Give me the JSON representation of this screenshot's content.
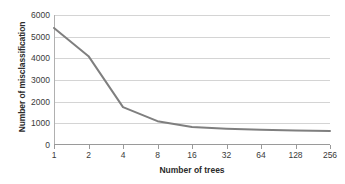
{
  "chart_data": {
    "type": "line",
    "title": "",
    "subtitle": "",
    "xlabel": "Number of trees",
    "ylabel": "Number of misclassification",
    "x_scale": "log2-categorical",
    "categories": [
      "1",
      "2",
      "4",
      "8",
      "16",
      "32",
      "64",
      "128",
      "256"
    ],
    "x": [
      1,
      2,
      4,
      8,
      16,
      32,
      64,
      128,
      256
    ],
    "values": [
      5400,
      4100,
      1750,
      1100,
      830,
      750,
      700,
      670,
      650
    ],
    "series": [
      {
        "name": "Number of misclassification",
        "values": [
          5400,
          4100,
          1750,
          1100,
          830,
          750,
          700,
          670,
          650
        ]
      }
    ],
    "ylim": [
      0,
      6000
    ],
    "y_ticks": [
      0,
      1000,
      2000,
      3000,
      4000,
      5000,
      6000
    ],
    "y_tick_labels": [
      "0",
      "1000",
      "2000",
      "3000",
      "4000",
      "5000",
      "6000"
    ],
    "grid": "horizontal",
    "legend": "none",
    "line_color": "#7f7f7f",
    "gridline_color": "#d4d4d4",
    "axis_color": "#9a9a9a",
    "background_color": "#ffffff"
  }
}
